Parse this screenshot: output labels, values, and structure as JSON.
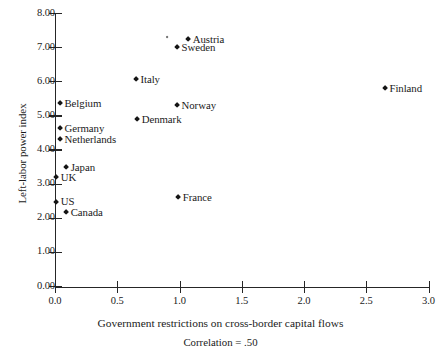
{
  "chart_data": {
    "type": "scatter",
    "title": "",
    "xlabel": "Government restrictions on cross-border capital flows",
    "ylabel": "Left-labor power index",
    "annotation": "Correlation =  .50",
    "xlim": [
      0.0,
      3.0
    ],
    "ylim": [
      0.0,
      8.0
    ],
    "xticks": [
      "0.0",
      "0.5",
      "1.0",
      "1.5",
      "2.0",
      "2.5",
      "3.0"
    ],
    "xtick_values": [
      0.0,
      0.5,
      1.0,
      1.5,
      2.0,
      2.5,
      3.0
    ],
    "yticks": [
      "0.00",
      "1.00",
      "2.00",
      "3.00",
      "4.00",
      "5.00",
      "6.00",
      "7.00",
      "8.00"
    ],
    "ytick_values": [
      0.0,
      1.0,
      2.0,
      3.0,
      4.0,
      5.0,
      6.0,
      7.0,
      8.0
    ],
    "grid": false,
    "legend": "none",
    "points": [
      {
        "label": "Austria",
        "x": 1.07,
        "y": 7.24,
        "label_pos": "right",
        "size": "normal"
      },
      {
        "label": "",
        "x": 0.9,
        "y": 7.3,
        "label_pos": "right",
        "size": "tiny"
      },
      {
        "label": "Sweden",
        "x": 0.98,
        "y": 7.01,
        "label_pos": "right",
        "size": "normal"
      },
      {
        "label": "Italy",
        "x": 0.65,
        "y": 6.07,
        "label_pos": "right",
        "size": "normal"
      },
      {
        "label": "Finland",
        "x": 2.65,
        "y": 5.81,
        "label_pos": "right",
        "size": "normal"
      },
      {
        "label": "Belgium",
        "x": 0.04,
        "y": 5.37,
        "label_pos": "right",
        "size": "normal"
      },
      {
        "label": "Norway",
        "x": 0.98,
        "y": 5.31,
        "label_pos": "right",
        "size": "normal"
      },
      {
        "label": "Denmark",
        "x": 0.66,
        "y": 4.9,
        "label_pos": "right",
        "size": "normal"
      },
      {
        "label": "Germany",
        "x": 0.04,
        "y": 4.63,
        "label_pos": "right",
        "size": "normal"
      },
      {
        "label": "Netherlands",
        "x": 0.04,
        "y": 4.31,
        "label_pos": "right",
        "size": "normal"
      },
      {
        "label": "Japan",
        "x": 0.09,
        "y": 3.49,
        "label_pos": "right",
        "size": "normal"
      },
      {
        "label": "UK",
        "x": 0.01,
        "y": 3.2,
        "label_pos": "right",
        "size": "normal"
      },
      {
        "label": "US",
        "x": 0.01,
        "y": 2.49,
        "label_pos": "right",
        "size": "normal"
      },
      {
        "label": "France",
        "x": 0.99,
        "y": 2.61,
        "label_pos": "right",
        "size": "normal"
      },
      {
        "label": "Canada",
        "x": 0.09,
        "y": 2.17,
        "label_pos": "right",
        "size": "normal"
      }
    ]
  }
}
